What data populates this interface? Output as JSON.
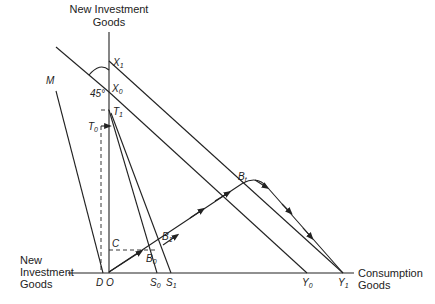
{
  "diagram": {
    "y_axis_title_line1": "New Investment",
    "y_axis_title_line2": "Goods",
    "x_axis_left_title_line1": "New",
    "x_axis_left_title_line2": "Investment",
    "x_axis_left_title_line3": "Goods",
    "x_axis_right_title_line1": "Consumption",
    "x_axis_right_title_line2": "Goods",
    "angle_label": "45°",
    "points": {
      "X1": {
        "base": "X",
        "sub": "1"
      },
      "X0": {
        "base": "X",
        "sub": "0"
      },
      "T1": {
        "base": "T",
        "sub": "1"
      },
      "T0": {
        "base": "T",
        "sub": "0"
      },
      "M": {
        "base": "M",
        "sub": ""
      },
      "C": {
        "base": "C",
        "sub": ""
      },
      "D": {
        "base": "D",
        "sub": ""
      },
      "O": {
        "base": "O",
        "sub": ""
      },
      "B0": {
        "base": "B",
        "sub": "0"
      },
      "B1": {
        "base": "B",
        "sub": "1"
      },
      "Bt": {
        "base": "B",
        "sub": "t"
      },
      "S0": {
        "base": "S",
        "sub": "0"
      },
      "S1": {
        "base": "S",
        "sub": "1"
      },
      "Y0": {
        "base": "Y",
        "sub": "0"
      },
      "Y1": {
        "base": "Y",
        "sub": "1"
      }
    }
  }
}
